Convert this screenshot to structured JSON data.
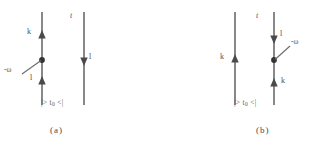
{
  "figure": {
    "background_color": "#ffffff",
    "line_color": "#6b6b6b",
    "text_color": "#4f4f4f",
    "width": 316,
    "height": 149
  },
  "panels": [
    {
      "id": "a",
      "caption": "(a)",
      "time_axis_label": "t",
      "state_label_prefix": "|> t",
      "state_label_sub": "0",
      "state_label_suffix": " <|",
      "lines": [
        {
          "name": "left-fermion-line",
          "x": 42,
          "y_top": 12,
          "y_bottom": 105,
          "arrows": [
            {
              "y": 36,
              "direction": "up",
              "label": "k",
              "label_x": 27,
              "label_y": 31
            },
            {
              "y": 82,
              "direction": "up",
              "label": "l",
              "label_x": 30,
              "label_y": 78
            }
          ],
          "vertex": {
            "y": 60
          }
        },
        {
          "name": "right-fermion-line",
          "x": 84,
          "y_top": 12,
          "y_bottom": 105,
          "arrows": [
            {
              "y": 60,
              "direction": "down",
              "label": "l",
              "label_x": 89,
              "label_y": 56
            }
          ],
          "vertex": null
        }
      ],
      "photon": {
        "name": "photon-line",
        "label": "-ω",
        "label_x": 4,
        "label_y": 69,
        "from_x": 22,
        "from_y": 74,
        "to_x": 41,
        "to_y": 60
      }
    },
    {
      "id": "b",
      "caption": "(b)",
      "time_axis_label": "t",
      "state_label_prefix": "|> t",
      "state_label_sub": "0",
      "state_label_suffix": " <|",
      "lines": [
        {
          "name": "left-fermion-line",
          "x": 77,
          "y_top": 12,
          "y_bottom": 105,
          "arrows": [
            {
              "y": 60,
              "direction": "up",
              "label": "k",
              "label_x": 62,
              "label_y": 56
            }
          ],
          "vertex": null
        },
        {
          "name": "right-fermion-line",
          "x": 116,
          "y_top": 12,
          "y_bottom": 105,
          "arrows": [
            {
              "y": 38,
              "direction": "down",
              "label": "l",
              "label_x": 121,
              "label_y": 33
            },
            {
              "y": 84,
              "direction": "up",
              "label": "k",
              "label_x": 122,
              "label_y": 80
            }
          ],
          "vertex": {
            "y": 60
          }
        }
      ],
      "photon": {
        "name": "photon-line",
        "label": "-ω",
        "label_x": 132,
        "label_y": 41,
        "from_x": 117,
        "from_y": 60,
        "to_x": 131,
        "to_y": 47
      }
    }
  ]
}
